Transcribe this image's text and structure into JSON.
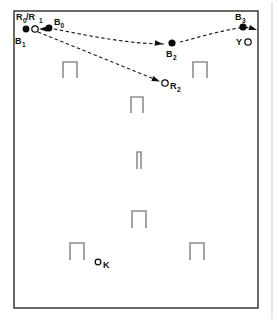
{
  "figure": {
    "caption": "",
    "type": "trajectory-diagram",
    "colors": {
      "arena_border": "#2b2b2b",
      "obstacle": "#8e8e8e",
      "trajectory": "#1a1a1a",
      "marker_filled": "#0b0b0b",
      "marker_open": "#ffffff",
      "page_edge": "#cfcfcf"
    },
    "arena": {
      "name": "arena-rectangle",
      "x": 14,
      "y": 11,
      "width": 244,
      "height": 297
    },
    "markers": [
      {
        "id": "B1",
        "label": "B",
        "sub": "1",
        "style": "filled",
        "x": 26,
        "y": 29,
        "r": 3.4,
        "label_x": 15,
        "label_y": 44,
        "sub_x": 22,
        "sub_y": 46.5
      },
      {
        "id": "R0R1",
        "label": "R",
        "sub": "0",
        "label2": "/R",
        "sub2": "1",
        "style": "open",
        "x": 35,
        "y": 29,
        "r": 3.2,
        "label_x": 16,
        "label_y": 20,
        "sub_x": 23,
        "sub_y": 22.5
      },
      {
        "id": "B0",
        "label": "B",
        "sub": "0",
        "style": "filled",
        "x": 49,
        "y": 28,
        "r": 3.4,
        "label_x": 54,
        "label_y": 25,
        "sub_x": 60.5,
        "sub_y": 27.5
      },
      {
        "id": "B2",
        "label": "B",
        "sub": "2",
        "style": "filled",
        "x": 172,
        "y": 43,
        "r": 3.6,
        "label_x": 166,
        "label_y": 57,
        "sub_x": 173,
        "sub_y": 59.5
      },
      {
        "id": "B3",
        "label": "B",
        "sub": "3",
        "style": "filled",
        "x": 243,
        "y": 27,
        "r": 3.6,
        "label_x": 235,
        "label_y": 20,
        "sub_x": 242,
        "sub_y": 22.5
      },
      {
        "id": "Y",
        "label": "Y",
        "sub": "",
        "style": "open",
        "x": 248,
        "y": 42,
        "r": 3.2,
        "label_x": 236,
        "label_y": 45,
        "sub_x": 0,
        "sub_y": 0
      },
      {
        "id": "R2",
        "label": "R",
        "sub": "2",
        "style": "open",
        "x": 165,
        "y": 83,
        "r": 3.2,
        "label_x": 170,
        "label_y": 89,
        "sub_x": 177,
        "sub_y": 91.5
      },
      {
        "id": "K",
        "label": "K",
        "sub": "",
        "style": "open",
        "x": 98,
        "y": 262,
        "r": 2.8,
        "label_x": 103,
        "label_y": 268,
        "sub_x": 0,
        "sub_y": 0
      }
    ],
    "trajectories": [
      {
        "name": "ball-path-b0-to-b2",
        "d": "M 54 29 C 90 36, 130 44, 164 44",
        "arrowheads": [
          {
            "x": 163,
            "y": 44,
            "angle": 7
          }
        ]
      },
      {
        "name": "ball-path-b2-to-b3",
        "d": "M 180 42 C 200 37, 222 30, 246 27",
        "arrowheads": []
      },
      {
        "name": "ball-path-b3-to-wall",
        "d": "M 245 27 L 256 30",
        "arrowheads": [
          {
            "x": 257,
            "y": 30,
            "angle": 18
          }
        ]
      },
      {
        "name": "robot-path-r1-to-r2",
        "d": "M 38 32 L 159 81",
        "arrowheads": [
          {
            "x": 160,
            "y": 81.5,
            "angle": 22
          }
        ]
      },
      {
        "name": "ball-path-b0-to-b1",
        "d": "M 45 29 L 39 29",
        "arrowheads": [
          {
            "x": 39,
            "y": 29,
            "angle": 180
          }
        ]
      }
    ],
    "obstacles": [
      {
        "name": "obstacle-left-upper",
        "x": 63,
        "y": 62,
        "w": 14,
        "h": 16,
        "t": 2.0
      },
      {
        "name": "obstacle-right-upper",
        "x": 193,
        "y": 62,
        "w": 14,
        "h": 16,
        "t": 2.0
      },
      {
        "name": "obstacle-center-upper",
        "x": 131,
        "y": 97,
        "w": 12,
        "h": 16,
        "t": 2.0
      },
      {
        "name": "obstacle-center-thin",
        "x": 137,
        "y": 152,
        "w": 4,
        "h": 17,
        "t": 1.6
      },
      {
        "name": "obstacle-center-lower",
        "x": 132,
        "y": 211,
        "w": 14,
        "h": 17,
        "t": 2.0
      },
      {
        "name": "obstacle-left-lower",
        "x": 70,
        "y": 243,
        "w": 14,
        "h": 17,
        "t": 2.0
      },
      {
        "name": "obstacle-right-lower",
        "x": 190,
        "y": 243,
        "w": 14,
        "h": 17,
        "t": 2.0
      }
    ],
    "page_edges": [
      {
        "name": "page-edge-right",
        "x1": 272,
        "y1": 2,
        "x2": 272,
        "y2": 319
      }
    ]
  }
}
